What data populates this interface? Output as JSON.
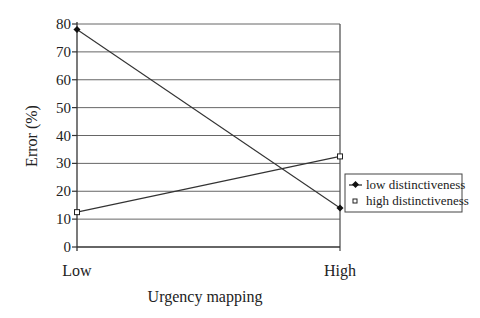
{
  "chart_data": {
    "type": "line",
    "title": "",
    "xlabel": "Urgency mapping",
    "ylabel": "Error (%)",
    "categories": [
      "Low",
      "High"
    ],
    "ylim": [
      0,
      80
    ],
    "yticks": [
      0,
      10,
      20,
      30,
      40,
      50,
      60,
      70,
      80
    ],
    "ytick_labels": [
      "0",
      "10",
      "20",
      "30",
      "40",
      "50",
      "60",
      "70",
      "80"
    ],
    "grid": true,
    "legend_position": "right",
    "series": [
      {
        "name": "low distinctiveness",
        "marker": "filled-diamond",
        "values": [
          78,
          14
        ]
      },
      {
        "name": "high distinctiveness",
        "marker": "open-square",
        "values": [
          12.5,
          32.5
        ]
      }
    ]
  },
  "colors": {
    "line": "#333333",
    "grid": "#555555",
    "background": "#ffffff"
  }
}
